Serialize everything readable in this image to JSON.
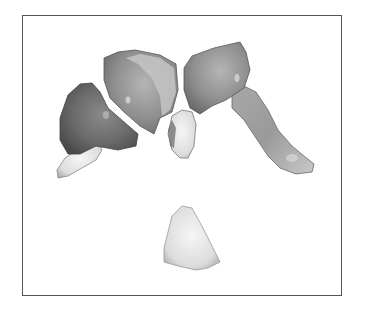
{
  "figure": {
    "frame": {
      "border_color": "#555555",
      "background": "#ffffff"
    },
    "objects": [
      {
        "id": "left-lateral-piece",
        "shade": "dark"
      },
      {
        "id": "left-central-piece",
        "shade": "medium"
      },
      {
        "id": "center-small-piece",
        "shade": "light"
      },
      {
        "id": "right-arm-piece",
        "shade": "medium"
      },
      {
        "id": "bottom-cone-piece",
        "shade": "light"
      }
    ]
  }
}
